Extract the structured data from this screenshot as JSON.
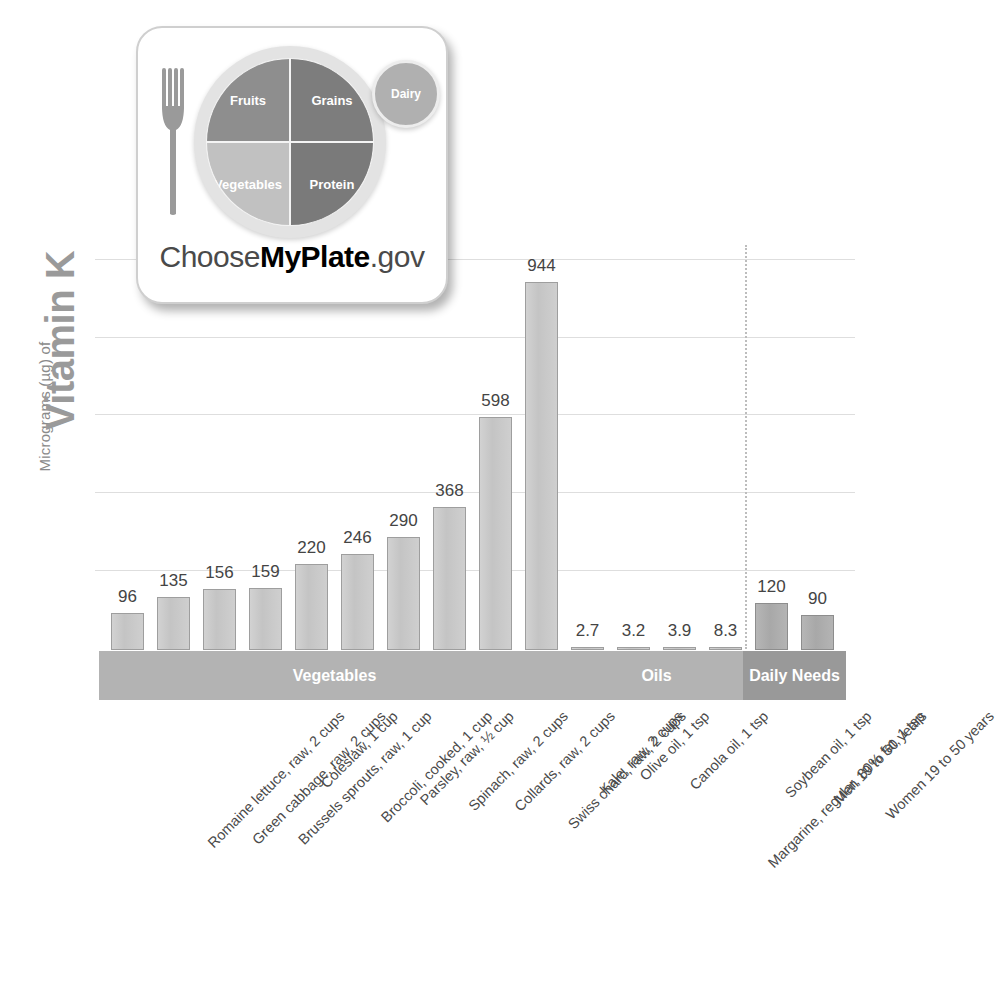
{
  "logo": {
    "alt": "ChooseMyPlate.gov",
    "plate_segments": [
      {
        "name": "Fruits"
      },
      {
        "name": "Grains"
      },
      {
        "name": "Vegetables"
      },
      {
        "name": "Protein"
      }
    ],
    "dairy_label": "Dairy",
    "wordmark": {
      "part1": "Choose",
      "part2": "MyPlate",
      "part3": ".gov"
    }
  },
  "chart_data": {
    "type": "bar",
    "title": "Vitamin K",
    "ylabel": "Micrograms (µg) of",
    "ylabel_full": "Micrograms (µg) of Vitamin K",
    "xlabel": "",
    "ylim": [
      0,
      1035
    ],
    "grid": true,
    "gridline_values": [
      200,
      400,
      600,
      800,
      1000
    ],
    "legend": "none",
    "categories": [
      "Romaine lettuce, raw, 2 cups",
      "Green cabbage, raw, 2 cups",
      "Brussels sprouts, raw, 1 cup",
      "Coleslaw, 1 cup",
      "Broccoli, cooked, 1 cup",
      "Parsley, raw, ½ cup",
      "Spinach, raw, 2 cups",
      "Collards, raw, 2 cups",
      "Swiss chard, raw, 2 cups",
      "Kale, raw, 2 cups",
      "Olive oil, 1 tsp",
      "Canola oil, 1 tsp",
      "Margarine, regular, 80% fat, 1 tsp",
      "Soybean oil, 1 tsp",
      "Men 19 to 50 years",
      "Women 19 to 50 years"
    ],
    "values": [
      96,
      135,
      156,
      159,
      220,
      246,
      290,
      368,
      598,
      944,
      2.7,
      3.2,
      3.9,
      8.3,
      120,
      90
    ],
    "value_labels": [
      "96",
      "135",
      "156",
      "159",
      "220",
      "246",
      "290",
      "368",
      "598",
      "944",
      "2.7",
      "3.2",
      "3.9",
      "8.3",
      "120",
      "90"
    ],
    "groups": [
      {
        "label": "Vegetables",
        "start_index": 0,
        "end_index": 9,
        "shade": "light"
      },
      {
        "label": "Oils",
        "start_index": 10,
        "end_index": 13,
        "shade": "light"
      },
      {
        "label": "Daily Needs",
        "start_index": 14,
        "end_index": 15,
        "shade": "dark"
      }
    ],
    "colors": {
      "bar_fill": "#c9c9c9",
      "bar_fill_dark": "#ababab",
      "bar_stroke": "#9e9e9e",
      "gridline": "#dedede",
      "band_light": "#b3b3b3",
      "band_dark": "#999999",
      "title": "#9a9a9a",
      "value_label": "#444444"
    }
  }
}
